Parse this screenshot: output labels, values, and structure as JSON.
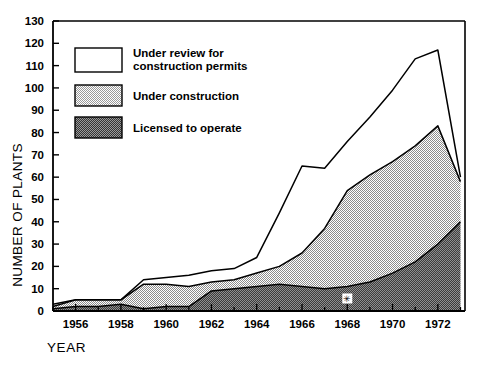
{
  "chart_data": {
    "type": "area",
    "stacked": true,
    "title": "",
    "xlabel": "YEAR",
    "ylabel": "NUMBER OF PLANTS",
    "xlim": [
      1955,
      1973.2
    ],
    "ylim": [
      0,
      130
    ],
    "ytick_step": 10,
    "xtick_step": 1,
    "xlabel_step": 2,
    "grid": false,
    "legend_position": "inside-upper-left",
    "yticks": [
      0,
      10,
      20,
      30,
      40,
      50,
      60,
      70,
      80,
      90,
      100,
      110,
      120,
      130
    ],
    "ytick_labels": [
      "0",
      "10",
      "20",
      "30",
      "40",
      "50",
      "60",
      "70",
      "80",
      "90",
      "100",
      "110",
      "120",
      "130"
    ],
    "xticks": [
      1955,
      1956,
      1957,
      1958,
      1959,
      1960,
      1961,
      1962,
      1963,
      1964,
      1965,
      1966,
      1967,
      1968,
      1969,
      1970,
      1971,
      1972,
      1973
    ],
    "xtick_labels": [
      "1956",
      "1958",
      "1960",
      "1962",
      "1964",
      "1966",
      "1968",
      "1970",
      "1972"
    ],
    "xtick_label_years": [
      1956,
      1958,
      1960,
      1962,
      1964,
      1966,
      1968,
      1970,
      1972
    ],
    "x": [
      1955,
      1956,
      1957,
      1958,
      1959,
      1960,
      1961,
      1962,
      1963,
      1964,
      1965,
      1966,
      1967,
      1968,
      1969,
      1970,
      1971,
      1972,
      1973
    ],
    "series": [
      {
        "name": "Licensed to operate",
        "fill": "dark-halftone",
        "color": "#555555",
        "values": [
          1,
          2,
          2,
          3,
          1,
          2,
          2,
          9,
          10,
          11,
          12,
          11,
          10,
          11,
          13,
          17,
          22,
          30,
          40
        ]
      },
      {
        "name": "Under construction",
        "fill": "light-halftone",
        "color": "#b8b8b8",
        "values": [
          1,
          3,
          3,
          2,
          11,
          10,
          9,
          4,
          4,
          6,
          8,
          15,
          27,
          43,
          48,
          50,
          52,
          53,
          18
        ]
      },
      {
        "name": "Under review for construction permits",
        "fill": "white",
        "color": "#ffffff",
        "values": [
          1,
          0,
          0,
          0,
          2,
          3,
          5,
          5,
          5,
          7,
          24,
          39,
          27,
          22,
          26,
          32,
          39,
          34,
          2
        ]
      }
    ],
    "cumulative_top_boundary": [
      3,
      5,
      5,
      5,
      14,
      15,
      16,
      18,
      19,
      24,
      44,
      65,
      64,
      76,
      87,
      99,
      113,
      117,
      60
    ],
    "cumulative_mid_boundary": [
      2,
      5,
      5,
      5,
      12,
      12,
      11,
      13,
      14,
      17,
      20,
      26,
      37,
      54,
      61,
      67,
      74,
      83,
      58
    ],
    "cumulative_bottom_boundary": [
      1,
      2,
      2,
      3,
      1,
      2,
      2,
      9,
      10,
      11,
      12,
      11,
      10,
      11,
      13,
      17,
      22,
      30,
      40
    ],
    "annotations": [
      {
        "name": "data-point-marker",
        "x": 1968,
        "y": 11,
        "symbol": "✳",
        "note": ""
      }
    ]
  },
  "legend": {
    "items": [
      {
        "label_line1": "Under review for",
        "label_line2": "construction permits",
        "swatch": "white"
      },
      {
        "label_line1": "Under construction",
        "label_line2": "",
        "swatch": "light-halftone"
      },
      {
        "label_line1": "Licensed to operate",
        "label_line2": "",
        "swatch": "dark-halftone"
      }
    ]
  },
  "axes": {
    "y_title": "NUMBER OF PLANTS",
    "x_title": "YEAR"
  },
  "colors": {
    "frame": "#000000",
    "light_fill": "#bfbfbf",
    "dark_fill": "#5a5a5a",
    "white_fill": "#ffffff",
    "text": "#000000"
  }
}
